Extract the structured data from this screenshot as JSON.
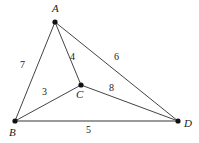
{
  "figure": {
    "type": "weighted-graph-diagram",
    "width": 199,
    "height": 143,
    "background_color": "#ffffff",
    "edge_color": "#222222",
    "highlight_edge_color": "#9a9a9a",
    "vertex_color": "#111111",
    "label_color": "#1a1a1a"
  },
  "vertices": [
    {
      "id": "A",
      "label": "A",
      "x": 55,
      "y": 22,
      "label_x": 52,
      "label_y": 3
    },
    {
      "id": "B",
      "label": "B",
      "x": 15,
      "y": 121,
      "label_x": 9,
      "label_y": 127
    },
    {
      "id": "C",
      "label": "C",
      "x": 81,
      "y": 85,
      "label_x": 76,
      "label_y": 89
    },
    {
      "id": "D",
      "label": "D",
      "x": 178,
      "y": 121,
      "label_x": 184,
      "label_y": 118
    }
  ],
  "edges": [
    {
      "id": "AB",
      "from": "A",
      "to": "B",
      "weight": "7",
      "label_x": 20,
      "label_y": 60,
      "style": "thin"
    },
    {
      "id": "AC",
      "from": "A",
      "to": "C",
      "weight": "4",
      "label_x": 70,
      "label_y": 52,
      "style": "thin"
    },
    {
      "id": "AD",
      "from": "A",
      "to": "D",
      "weight": "6",
      "label_x": 114,
      "label_y": 52,
      "style": "thin"
    },
    {
      "id": "BC",
      "from": "B",
      "to": "C",
      "weight": "3",
      "label_x": 42,
      "label_y": 87,
      "style": "thin"
    },
    {
      "id": "CD",
      "from": "C",
      "to": "D",
      "weight": "8",
      "label_x": 109,
      "label_y": 83,
      "style": "thin"
    },
    {
      "id": "BD",
      "from": "B",
      "to": "D",
      "weight": "5",
      "label_x": 86,
      "label_y": 125,
      "style": "thick-gray"
    }
  ]
}
